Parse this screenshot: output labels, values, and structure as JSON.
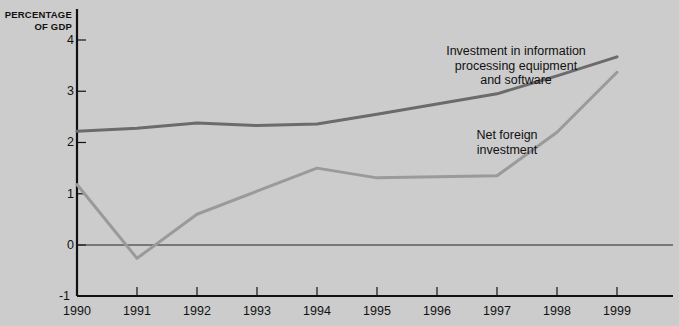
{
  "chart_data": {
    "type": "line",
    "title": "",
    "xlabel": "",
    "ylabel": "PERCENTAGE\nOF GDP",
    "ylabel_line1": "PERCENTAGE",
    "ylabel_line2": "OF GDP",
    "x": [
      1990,
      1991,
      1992,
      1993,
      1994,
      1995,
      1996,
      1997,
      1998,
      1999
    ],
    "categories": [
      "1990",
      "1991",
      "1992",
      "1993",
      "1994",
      "1995",
      "1996",
      "1997",
      "1998",
      "1999"
    ],
    "xlim": [
      1990,
      1999
    ],
    "ylim": [
      -1,
      4
    ],
    "yticks": [
      4,
      3,
      2,
      1,
      0,
      -1
    ],
    "ytick_labels": [
      "4",
      "3",
      "2",
      "1",
      "0",
      "-1"
    ],
    "grid": false,
    "zero_line": true,
    "legend_position": "inline-annotations",
    "series": [
      {
        "name": "Investment in information processing equipment and software",
        "label_lines": [
          "Investment in information",
          "processing equipment",
          "and software"
        ],
        "color": "#6b6b6b",
        "values": [
          2.22,
          2.28,
          2.38,
          2.33,
          2.36,
          2.55,
          2.75,
          2.95,
          3.3,
          3.67
        ]
      },
      {
        "name": "Net foreign investment",
        "label_lines": [
          "Net foreign",
          "investment"
        ],
        "color": "#9a9a9a",
        "values": [
          1.18,
          -0.26,
          0.6,
          1.05,
          1.5,
          1.31,
          1.33,
          1.35,
          2.2,
          3.37
        ]
      }
    ]
  },
  "colors": {
    "background": "#cccccc",
    "axis": "#111111",
    "zero_line": "#222222",
    "series_dark": "#6b6b6b",
    "series_light": "#9a9a9a",
    "text": "#111111"
  },
  "annotations": {
    "investment": "Investment in information\nprocessing equipment\nand software",
    "net_foreign": "Net foreign\ninvestment"
  }
}
